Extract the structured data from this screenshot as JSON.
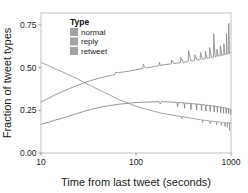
{
  "chart_data": {
    "type": "line",
    "title": "",
    "xlabel": "Time from last tweet (seconds)",
    "ylabel": "Fraction of tweet types",
    "xscale": "log",
    "xlim": [
      10,
      1000
    ],
    "ylim": [
      0.0,
      0.82
    ],
    "grid": false,
    "xticks": [
      10,
      100,
      1000
    ],
    "xtick_labels": [
      "10",
      "100",
      "1000"
    ],
    "yticks": [
      0.0,
      0.25,
      0.5,
      0.75
    ],
    "ytick_labels": [
      "0.00",
      "0.25",
      "0.50",
      "0.75"
    ],
    "legend": {
      "title": "Type",
      "position": "top-left-inside",
      "entries": [
        "normal",
        "reply",
        "retweet"
      ]
    },
    "series": [
      {
        "name": "normal",
        "color": "#8f8f8f",
        "x": [
          10,
          12,
          14,
          17,
          20,
          24,
          28,
          33,
          39,
          46,
          55,
          60,
          61,
          65,
          72,
          85,
          100,
          110,
          118,
          119,
          125,
          140,
          160,
          175,
          177,
          180,
          200,
          225,
          235,
          237,
          250,
          280,
          295,
          297,
          315,
          350,
          355,
          357,
          380,
          410,
          415,
          417,
          440,
          470,
          475,
          477,
          500,
          530,
          535,
          537,
          560,
          590,
          595,
          597,
          620,
          650,
          655,
          657,
          680,
          700,
          710,
          712,
          730,
          760,
          770,
          772,
          800,
          830,
          840,
          842,
          860,
          880,
          895,
          897,
          910,
          930,
          945,
          947,
          960,
          980,
          995,
          1000
        ],
        "y": [
          0.3,
          0.32,
          0.34,
          0.36,
          0.378,
          0.395,
          0.41,
          0.423,
          0.435,
          0.445,
          0.455,
          0.46,
          0.472,
          0.47,
          0.474,
          0.48,
          0.487,
          0.492,
          0.496,
          0.52,
          0.498,
          0.502,
          0.508,
          0.512,
          0.53,
          0.513,
          0.517,
          0.521,
          0.523,
          0.545,
          0.524,
          0.528,
          0.53,
          0.56,
          0.531,
          0.535,
          0.536,
          0.6,
          0.538,
          0.541,
          0.542,
          0.575,
          0.544,
          0.547,
          0.548,
          0.59,
          0.549,
          0.552,
          0.553,
          0.596,
          0.554,
          0.557,
          0.558,
          0.618,
          0.559,
          0.562,
          0.563,
          0.7,
          0.564,
          0.566,
          0.567,
          0.608,
          0.568,
          0.57,
          0.571,
          0.628,
          0.572,
          0.574,
          0.575,
          0.64,
          0.576,
          0.578,
          0.579,
          0.7,
          0.58,
          0.582,
          0.583,
          0.76,
          0.584,
          0.586,
          0.588,
          0.585
        ],
        "description": "Rises from ~0.30 at 10s to ~0.58 at 1000s with periodic upward spikes reaching ~0.76"
      },
      {
        "name": "reply",
        "color": "#9a9a9a",
        "x": [
          10,
          12,
          14,
          17,
          20,
          24,
          28,
          33,
          39,
          46,
          55,
          65,
          78,
          92,
          110,
          130,
          155,
          180,
          200,
          230,
          265,
          300,
          305,
          307,
          330,
          360,
          390,
          420,
          450,
          480,
          500,
          505,
          507,
          530,
          560,
          590,
          600,
          605,
          607,
          630,
          660,
          690,
          700,
          705,
          707,
          730,
          760,
          780,
          790,
          792,
          810,
          830,
          850,
          860,
          865,
          867,
          880,
          900,
          910,
          915,
          917,
          930,
          950,
          960,
          965,
          967,
          980,
          1000
        ],
        "y": [
          0.53,
          0.512,
          0.494,
          0.474,
          0.455,
          0.435,
          0.415,
          0.395,
          0.375,
          0.355,
          0.335,
          0.315,
          0.297,
          0.281,
          0.267,
          0.255,
          0.244,
          0.235,
          0.23,
          0.224,
          0.218,
          0.213,
          0.2,
          0.213,
          0.21,
          0.206,
          0.203,
          0.2,
          0.197,
          0.195,
          0.193,
          0.178,
          0.193,
          0.192,
          0.19,
          0.188,
          0.187,
          0.17,
          0.187,
          0.186,
          0.185,
          0.184,
          0.183,
          0.165,
          0.183,
          0.182,
          0.181,
          0.181,
          0.18,
          0.16,
          0.18,
          0.179,
          0.179,
          0.178,
          0.155,
          0.178,
          0.178,
          0.177,
          0.177,
          0.15,
          0.177,
          0.177,
          0.176,
          0.176,
          0.13,
          0.176,
          0.176,
          0.175
        ],
        "description": "Falls from ~0.53 at 10s to ~0.18 at 1000s with downward spike notches after 300s"
      },
      {
        "name": "retweet",
        "color": "#878787",
        "x": [
          10,
          12,
          14,
          17,
          20,
          24,
          28,
          33,
          39,
          46,
          55,
          65,
          78,
          92,
          110,
          125,
          140,
          160,
          175,
          180,
          185,
          200,
          220,
          240,
          260,
          270,
          275,
          277,
          290,
          310,
          320,
          325,
          327,
          340,
          360,
          375,
          380,
          382,
          395,
          415,
          430,
          435,
          437,
          450,
          470,
          485,
          490,
          492,
          505,
          525,
          540,
          545,
          547,
          560,
          580,
          600,
          605,
          607,
          620,
          645,
          660,
          665,
          667,
          680,
          700,
          715,
          720,
          722,
          740,
          760,
          775,
          780,
          782,
          795,
          815,
          830,
          835,
          837,
          850,
          870,
          885,
          890,
          892,
          905,
          925,
          940,
          945,
          947,
          960,
          980,
          990,
          992,
          1000
        ],
        "y": [
          0.168,
          0.18,
          0.192,
          0.205,
          0.218,
          0.231,
          0.243,
          0.254,
          0.264,
          0.272,
          0.279,
          0.285,
          0.29,
          0.294,
          0.297,
          0.298,
          0.299,
          0.3,
          0.3,
          0.288,
          0.3,
          0.3,
          0.299,
          0.298,
          0.297,
          0.296,
          0.27,
          0.296,
          0.295,
          0.294,
          0.293,
          0.262,
          0.293,
          0.292,
          0.291,
          0.29,
          0.255,
          0.29,
          0.289,
          0.288,
          0.287,
          0.25,
          0.287,
          0.286,
          0.285,
          0.284,
          0.248,
          0.284,
          0.283,
          0.282,
          0.281,
          0.245,
          0.281,
          0.28,
          0.279,
          0.278,
          0.242,
          0.278,
          0.277,
          0.276,
          0.275,
          0.24,
          0.275,
          0.274,
          0.273,
          0.272,
          0.238,
          0.272,
          0.271,
          0.27,
          0.269,
          0.236,
          0.269,
          0.268,
          0.267,
          0.266,
          0.234,
          0.266,
          0.265,
          0.264,
          0.263,
          0.232,
          0.263,
          0.262,
          0.261,
          0.26,
          0.23,
          0.26,
          0.259,
          0.258,
          0.257,
          0.225,
          0.256
        ],
        "description": "Rises from ~0.17 at 10s to a plateau near 0.30, then slowly declines to ~0.26 with downward notches"
      }
    ]
  },
  "colors": {
    "panel_background": "#ffffff",
    "panel_border": "#b9b9b9",
    "text": "#1a1a1a",
    "tick": "#6e6e6e",
    "legend_swatch": "#a3a3a3"
  }
}
